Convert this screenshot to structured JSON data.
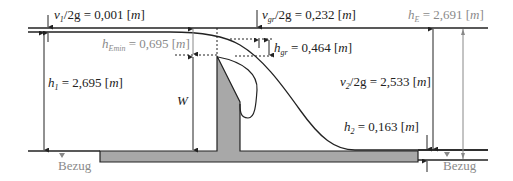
{
  "diagram": {
    "labels": {
      "v1": {
        "symbol": "v",
        "sub": "1",
        "rest": "/2g = 0,001 [",
        "unit": "m",
        "close": "]"
      },
      "hEmin": {
        "symbol": "h",
        "sub": "Emin",
        "rest": " = 0,695 [",
        "unit": "m",
        "close": "]"
      },
      "h1": {
        "symbol": "h",
        "sub": "1",
        "rest": " = 2,695 [",
        "unit": "m",
        "close": "]"
      },
      "W": {
        "symbol": "W"
      },
      "vgr": {
        "symbol": "v",
        "sub": "gr",
        "rest": "/2g = 0,232 [",
        "unit": "m",
        "close": "]"
      },
      "hgr": {
        "symbol": "h",
        "sub": "gr",
        "rest": " = 0,464 [",
        "unit": "m",
        "close": "]"
      },
      "hE": {
        "symbol": "h",
        "sub": "E",
        "rest": " = 2,691 [",
        "unit": "m",
        "close": "]"
      },
      "v2": {
        "symbol": "v",
        "sub": "2",
        "rest": "/2g = 2,533 [",
        "unit": "m",
        "close": "]"
      },
      "h2": {
        "symbol": "h",
        "sub": "2",
        "rest": " = 0,163 [",
        "unit": "m",
        "close": "]"
      },
      "bezug_left": "Bezug",
      "bezug_right": "Bezug"
    },
    "colors": {
      "line": "#222222",
      "gray_label": "#8a8a8a",
      "weir_fill": "#a8a8a8",
      "gray_arrow": "#888888"
    }
  }
}
